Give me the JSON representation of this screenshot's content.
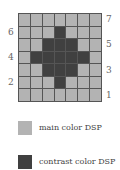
{
  "grid": {
    "rows": 7,
    "cols": 7,
    "pattern": [
      [
        0,
        0,
        0,
        0,
        0,
        0,
        0
      ],
      [
        0,
        0,
        0,
        1,
        0,
        0,
        0
      ],
      [
        0,
        0,
        1,
        1,
        1,
        0,
        0
      ],
      [
        0,
        1,
        1,
        1,
        1,
        1,
        0
      ],
      [
        0,
        0,
        1,
        1,
        1,
        0,
        0
      ],
      [
        0,
        0,
        0,
        1,
        0,
        0,
        0
      ],
      [
        0,
        0,
        0,
        0,
        0,
        0,
        0
      ]
    ],
    "row_labels_right": [
      "7",
      "5",
      "3",
      "1"
    ],
    "row_labels_left": [
      "6",
      "4",
      "2"
    ]
  },
  "colors": {
    "main": "#b3b3b3",
    "contrast": "#404040",
    "line": "#555555"
  },
  "legend": [
    {
      "label": "main color DSP",
      "color": "#b3b3b3"
    },
    {
      "label": "contrast color DSP",
      "color": "#404040"
    }
  ]
}
